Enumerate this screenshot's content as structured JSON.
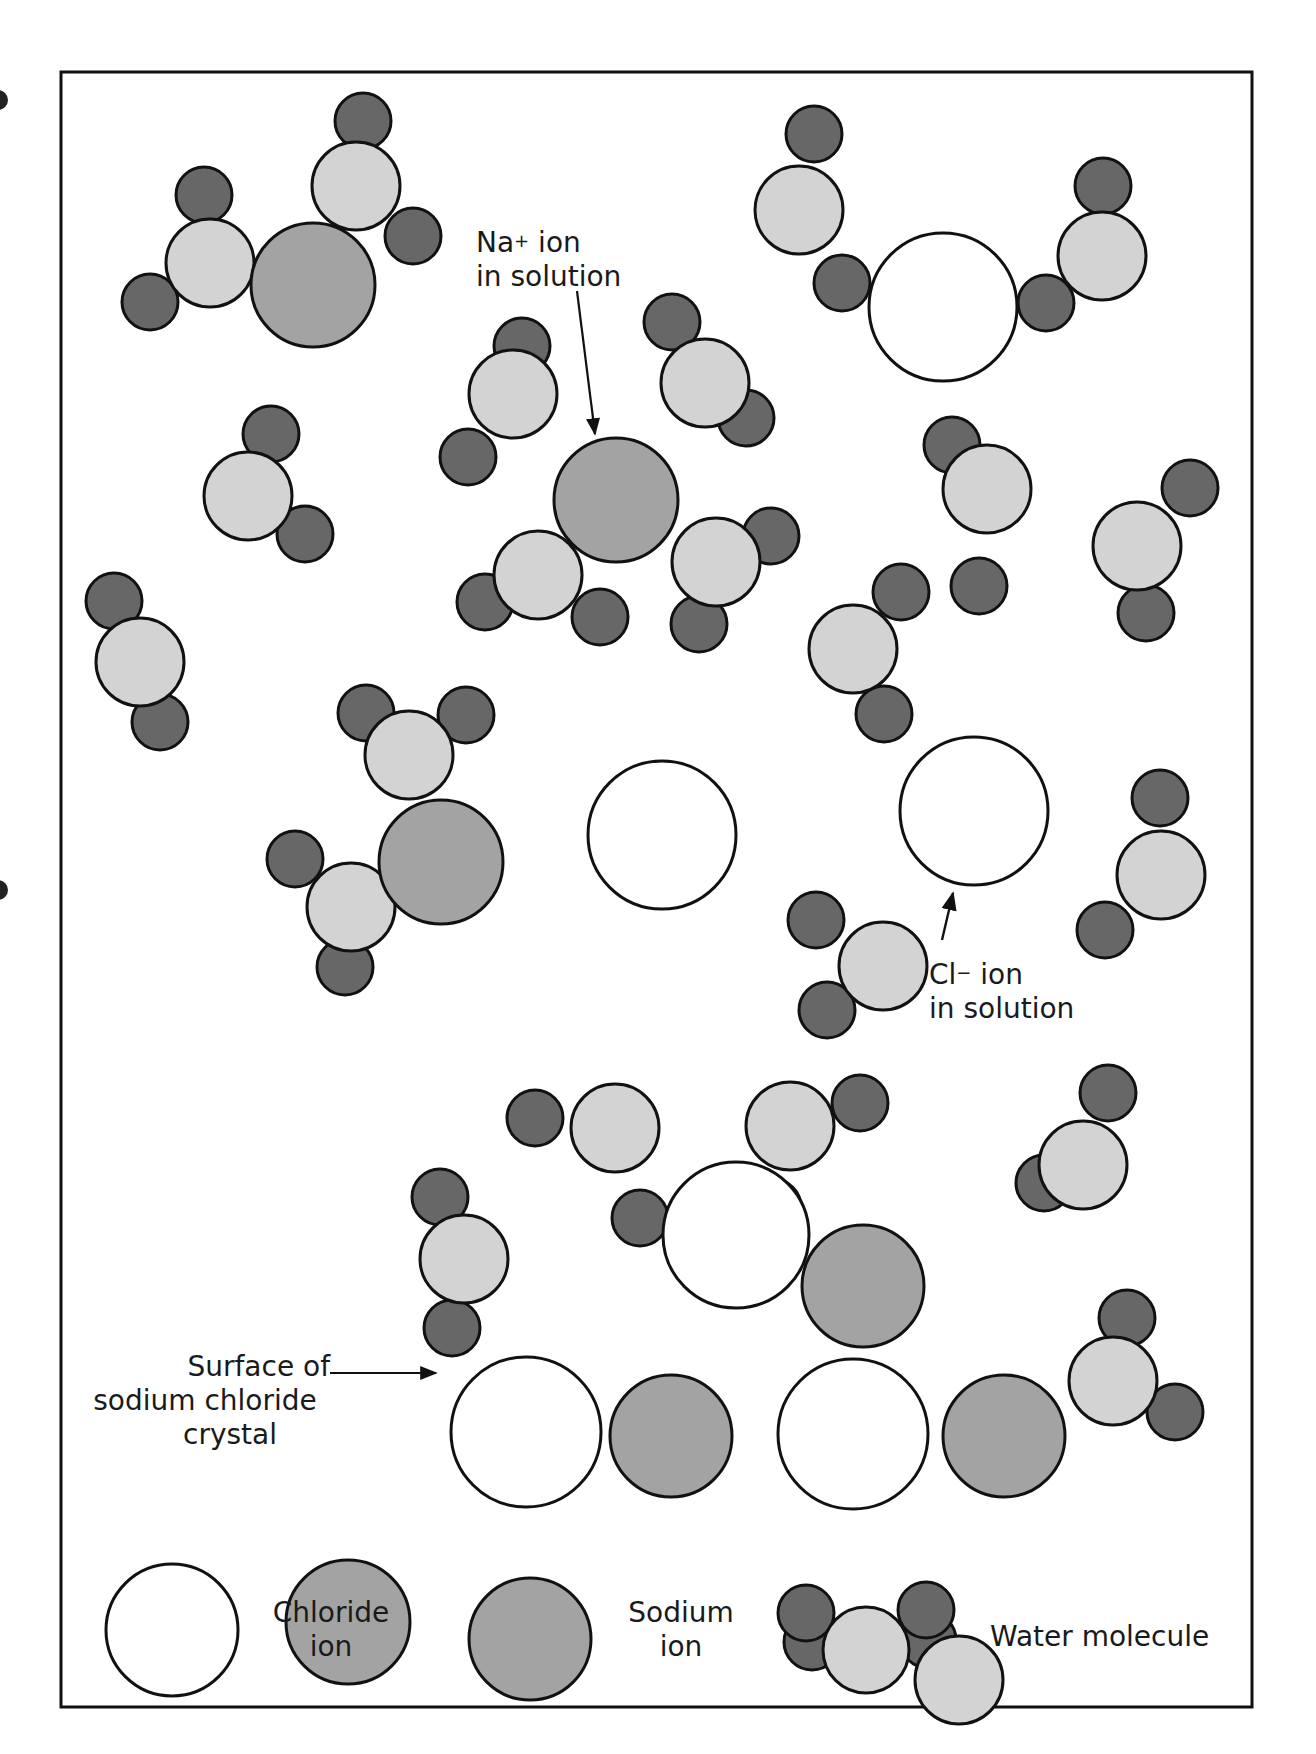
{
  "figure": {
    "frame": {
      "x": 61,
      "y": 72,
      "w": 1191,
      "h": 1635
    }
  },
  "colors": {
    "chloride_fill": "#ffffff",
    "sodium_fill": "#a3a3a3",
    "oxygen_fill": "#d3d3d3",
    "hydrogen_fill": "#676767",
    "stroke": "#111111",
    "text": "#1a1a1a"
  },
  "labels": {
    "na_ion": {
      "line1_base": "Na",
      "line1_sup": "+",
      "line1_rest": " ion",
      "line2": "in solution"
    },
    "cl_ion": {
      "line1_base": "Cl",
      "line1_sup": "−",
      "line1_rest": " ion",
      "line2": "in solution"
    },
    "surface": {
      "line1": "Surface of",
      "line2": "sodium chloride",
      "line3": "crystal"
    }
  },
  "legend": {
    "chloride": {
      "line1": "Chloride",
      "line2": "ion"
    },
    "sodium": {
      "line1": "Sodium",
      "line2": "ion"
    },
    "water": {
      "label": "Water molecule"
    }
  },
  "particles": {
    "chloride": [
      [
        943,
        307,
        74
      ],
      [
        662,
        835,
        74
      ],
      [
        974,
        811,
        74
      ],
      [
        736,
        1235,
        73
      ],
      [
        526,
        1432,
        75
      ],
      [
        853,
        1434,
        75
      ]
    ],
    "sodium": [
      [
        313,
        285,
        62
      ],
      [
        616,
        500,
        62
      ],
      [
        441,
        862,
        62
      ],
      [
        863,
        1286,
        61
      ],
      [
        671,
        1436,
        61
      ],
      [
        1004,
        1436,
        61
      ],
      [
        348,
        1622,
        62
      ]
    ],
    "oxygen": [
      [
        210,
        263,
        44
      ],
      [
        356,
        186,
        44
      ],
      [
        248,
        496,
        44
      ],
      [
        513,
        394,
        44
      ],
      [
        705,
        383,
        44
      ],
      [
        538,
        575,
        44
      ],
      [
        716,
        562,
        44
      ],
      [
        799,
        210,
        44
      ],
      [
        1102,
        256,
        44
      ],
      [
        987,
        489,
        44
      ],
      [
        1137,
        546,
        44
      ],
      [
        140,
        662,
        44
      ],
      [
        409,
        755,
        44
      ],
      [
        351,
        907,
        44
      ],
      [
        883,
        966,
        44
      ],
      [
        853,
        649,
        44
      ],
      [
        1161,
        875,
        44
      ],
      [
        464,
        1259,
        44
      ],
      [
        615,
        1128,
        44
      ],
      [
        790,
        1126,
        44
      ],
      [
        1083,
        1165,
        44
      ],
      [
        1113,
        1381,
        44
      ],
      [
        959,
        1680,
        44
      ]
    ],
    "hydrogen": [
      [
        204,
        195,
        28
      ],
      [
        150,
        302,
        28
      ],
      [
        363,
        121,
        28
      ],
      [
        413,
        236,
        28
      ],
      [
        271,
        434,
        28
      ],
      [
        305,
        534,
        28
      ],
      [
        522,
        346,
        28
      ],
      [
        468,
        457,
        28
      ],
      [
        672,
        322,
        28
      ],
      [
        746,
        418,
        28
      ],
      [
        485,
        602,
        28
      ],
      [
        600,
        617,
        28
      ],
      [
        771,
        536,
        28
      ],
      [
        699,
        624,
        28
      ],
      [
        814,
        134,
        28
      ],
      [
        842,
        283,
        28
      ],
      [
        1103,
        186,
        28
      ],
      [
        1046,
        303,
        28
      ],
      [
        952,
        445,
        28
      ],
      [
        979,
        586,
        28
      ],
      [
        1190,
        488,
        28
      ],
      [
        1146,
        613,
        28
      ],
      [
        114,
        601,
        28
      ],
      [
        160,
        722,
        28
      ],
      [
        366,
        713,
        28
      ],
      [
        466,
        715,
        28
      ],
      [
        295,
        859,
        28
      ],
      [
        345,
        967,
        28
      ],
      [
        816,
        920,
        28
      ],
      [
        827,
        1010,
        28
      ],
      [
        901,
        592,
        28
      ],
      [
        884,
        714,
        28
      ],
      [
        1160,
        798,
        28
      ],
      [
        1105,
        930,
        28
      ],
      [
        440,
        1197,
        28
      ],
      [
        452,
        1328,
        28
      ],
      [
        535,
        1118,
        28
      ],
      [
        640,
        1218,
        28
      ],
      [
        860,
        1103,
        28
      ],
      [
        773,
        1207,
        28
      ],
      [
        1044,
        1183,
        28
      ],
      [
        1108,
        1093,
        28
      ],
      [
        1127,
        1318,
        28
      ],
      [
        1175,
        1412,
        28
      ],
      [
        812,
        1642,
        28
      ],
      [
        928,
        1640,
        28
      ]
    ]
  },
  "legend_shapes": {
    "chloride": [
      172,
      1628,
      66
    ],
    "sodium_check": "see particles.sodium last entry"
  }
}
